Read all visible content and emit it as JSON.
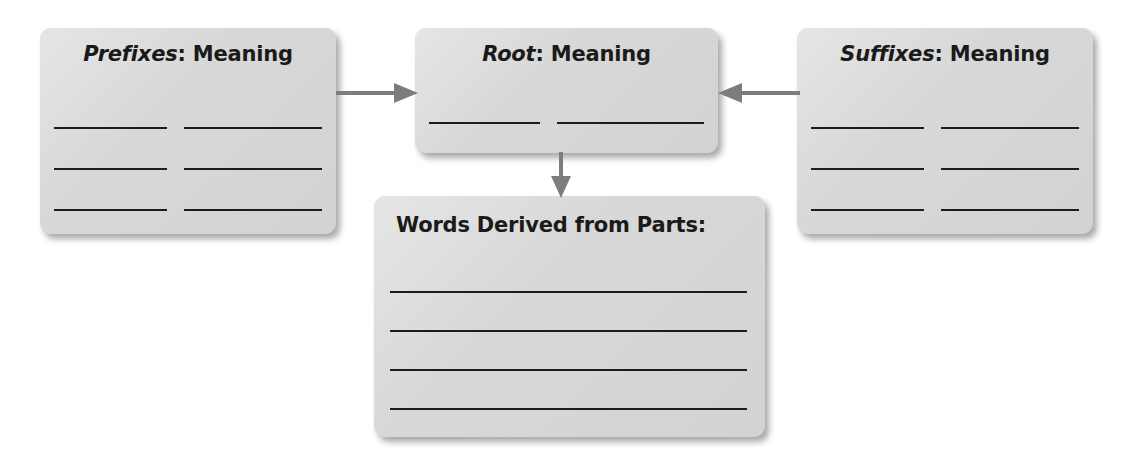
{
  "diagram": {
    "type": "word-parts-graphic-organizer",
    "background_color": "#ffffff",
    "card_fill_color": "#d6d6d6",
    "rule_color": "#1c1c1c",
    "arrow_color": "#7d7d7d",
    "cards": [
      {
        "id": "prefixes",
        "term": "Prefixes",
        "separator": ":",
        "label": " Meaning",
        "title_align": "center",
        "blank_rows": 3,
        "blanks_per_row": 2
      },
      {
        "id": "root",
        "term": "Root",
        "separator": ":",
        "label": " Meaning",
        "title_align": "center",
        "blank_rows": 1,
        "blanks_per_row": 2
      },
      {
        "id": "suffixes",
        "term": "Suffixes",
        "separator": ":",
        "label": " Meaning",
        "title_align": "center",
        "blank_rows": 3,
        "blanks_per_row": 2
      },
      {
        "id": "words-derived",
        "term": "",
        "separator": "",
        "label": "Words Derived from Parts:",
        "title_align": "left",
        "blank_rows": 4,
        "blanks_per_row": 1
      }
    ],
    "arrows": [
      {
        "id": "prefixes-to-root",
        "direction": "right"
      },
      {
        "id": "suffixes-to-root",
        "direction": "left"
      },
      {
        "id": "root-to-words",
        "direction": "down"
      }
    ]
  }
}
